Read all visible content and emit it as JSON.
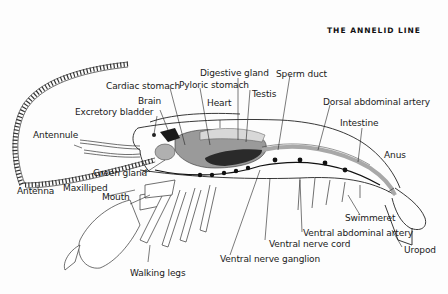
{
  "header": {
    "title": "THE ANNELID LINE"
  },
  "diagram": {
    "labels": [
      {
        "id": "cardiac_stomach",
        "text": "Cardiac stomach"
      },
      {
        "id": "digestive_gland",
        "text": "Digestive gland"
      },
      {
        "id": "pyloric_stomach",
        "text": "Pyloric stomach"
      },
      {
        "id": "sperm_duct",
        "text": "Sperm duct"
      },
      {
        "id": "brain",
        "text": "Brain"
      },
      {
        "id": "testis",
        "text": "Testis"
      },
      {
        "id": "heart",
        "text": "Heart"
      },
      {
        "id": "dorsal_abdominal_artery",
        "text": "Dorsal abdominal artery"
      },
      {
        "id": "excretory_bladder",
        "text": "Excretory bladder"
      },
      {
        "id": "intestine",
        "text": "Intestine"
      },
      {
        "id": "antennule",
        "text": "Antennule"
      },
      {
        "id": "anus",
        "text": "Anus"
      },
      {
        "id": "green_gland",
        "text": "Green gland"
      },
      {
        "id": "antenna",
        "text": "Antenna"
      },
      {
        "id": "maxilliped",
        "text": "Maxilliped"
      },
      {
        "id": "mouth",
        "text": "Mouth"
      },
      {
        "id": "swimmeret",
        "text": "Swimmeret"
      },
      {
        "id": "ventral_abdominal_artery",
        "text": "Ventral abdominal artery"
      },
      {
        "id": "ventral_nerve_cord",
        "text": "Ventral nerve cord"
      },
      {
        "id": "uropod",
        "text": "Uropod"
      },
      {
        "id": "ventral_nerve_ganglion",
        "text": "Ventral nerve ganglion"
      },
      {
        "id": "walking_legs",
        "text": "Walking legs"
      }
    ]
  },
  "colors": {
    "ink": "#1a1a1a",
    "organ_gray": "#9a9a9a",
    "dark_organ": "#2a2a2a",
    "light_gray": "#cfcfcf",
    "paper": "#fdfdfd"
  }
}
